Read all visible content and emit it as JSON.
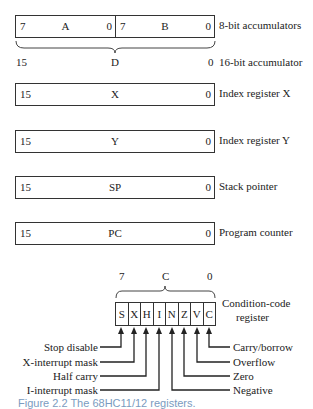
{
  "accumulators": {
    "a": {
      "hi": "7",
      "name": "A",
      "lo": "0"
    },
    "b": {
      "hi": "7",
      "name": "B",
      "lo": "0"
    },
    "label_8bit": "8-bit accumulators",
    "d": {
      "hi": "15",
      "name": "D",
      "lo": "0"
    },
    "label_16bit": "16-bit accumulator"
  },
  "registers": [
    {
      "hi": "15",
      "name": "X",
      "lo": "0",
      "label": "Index register X"
    },
    {
      "hi": "15",
      "name": "Y",
      "lo": "0",
      "label": "Index register Y"
    },
    {
      "hi": "15",
      "name": "SP",
      "lo": "0",
      "label": "Stack pointer"
    },
    {
      "hi": "15",
      "name": "PC",
      "lo": "0",
      "label": "Program counter"
    }
  ],
  "ccr": {
    "hi": "7",
    "name": "C",
    "lo": "0",
    "label_line1": "Condition-code",
    "label_line2": "register",
    "bits": [
      "S",
      "X",
      "H",
      "I",
      "N",
      "Z",
      "V",
      "C"
    ],
    "left_labels": [
      "Stop disable",
      "X-interrupt mask",
      "Half carry",
      "I-interrupt mask"
    ],
    "right_labels": [
      "Carry/borrow",
      "Overflow",
      "Zero",
      "Negative"
    ]
  },
  "caption": "Figure 2.2  The 68HC11/12 registers."
}
